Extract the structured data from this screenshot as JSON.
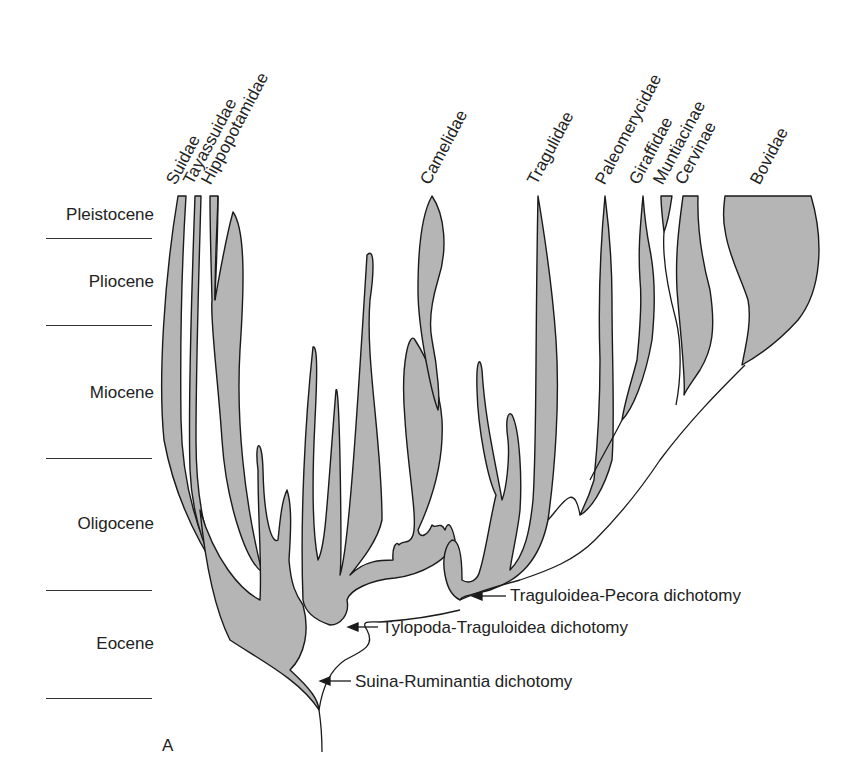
{
  "diagram": {
    "type": "phylogenetic-tree",
    "panel_label": "A",
    "colors": {
      "lineage_fill": "#b5b5b5",
      "outline": "#1a1a1a",
      "background": "#ffffff"
    },
    "epochs": [
      {
        "label": "Pleistocene",
        "y": 215
      },
      {
        "label": "Pliocene",
        "y": 282
      },
      {
        "label": "Miocene",
        "y": 393
      },
      {
        "label": "Oligocene",
        "y": 524
      },
      {
        "label": "Eocene",
        "y": 644
      }
    ],
    "epoch_dividers_y": [
      238,
      325,
      458,
      590,
      698
    ],
    "taxa": [
      {
        "label": "Suidae",
        "x": 174,
        "y": 190
      },
      {
        "label": "Tayassuidae",
        "x": 191,
        "y": 190
      },
      {
        "label": "Hippopotamidae",
        "x": 209,
        "y": 190
      },
      {
        "label": "Camelidae",
        "x": 428,
        "y": 190
      },
      {
        "label": "Tragulidae",
        "x": 535,
        "y": 190
      },
      {
        "label": "Paleomerycidae",
        "x": 603,
        "y": 190
      },
      {
        "label": "Giraffidae",
        "x": 637,
        "y": 190
      },
      {
        "label": "Muntiacinae",
        "x": 661,
        "y": 190
      },
      {
        "label": "Cervinae",
        "x": 683,
        "y": 190
      },
      {
        "label": "Bovidae",
        "x": 758,
        "y": 190
      }
    ],
    "dichotomies": [
      {
        "label": "Traguloidea-Pecora dichotomy",
        "x": 510,
        "y": 597
      },
      {
        "label": "Tylopoda-Traguloidea dichotomy",
        "x": 382,
        "y": 630
      },
      {
        "label": "Suina-Ruminantia dichotomy",
        "x": 355,
        "y": 686
      }
    ]
  }
}
